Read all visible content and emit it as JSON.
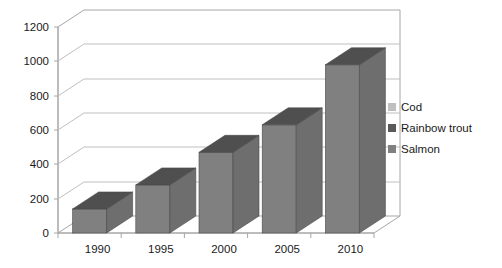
{
  "chart_data": {
    "type": "bar",
    "title": "",
    "subtitle": "",
    "xlabel": "",
    "ylabel": "",
    "categories": [
      "1990",
      "1995",
      "2000",
      "2005",
      "2010"
    ],
    "series": [
      {
        "name": "Salmon",
        "color": "#808080",
        "values": [
          140,
          280,
          470,
          630,
          980
        ]
      }
    ],
    "legend": [
      {
        "label": "Cod",
        "color": "#c0c0c0"
      },
      {
        "label": "Rainbow trout",
        "color": "#5a5a5a"
      },
      {
        "label": "Salmon",
        "color": "#808080"
      }
    ],
    "legend_position": "right",
    "ylim": [
      0,
      1200
    ],
    "ytick_step": 200,
    "yticks": [
      "0",
      "200",
      "400",
      "600",
      "800",
      "1000",
      "1200"
    ],
    "grid": true,
    "style": "3d-column",
    "axis_color": "#a6a6a6",
    "gridline_color": "#bfbfbf",
    "bar_top_color": "#4f4f4f",
    "bar_side_color": "#6e6e6e",
    "plot_background": "#ffffff"
  }
}
